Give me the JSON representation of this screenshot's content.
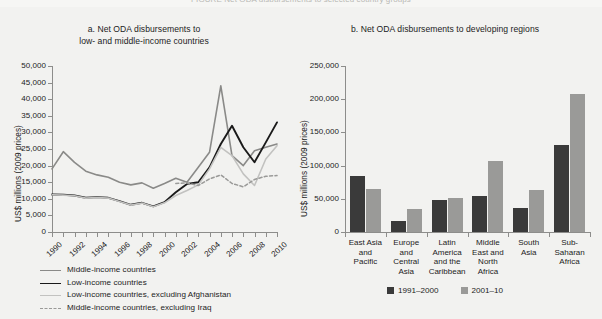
{
  "page": {
    "cropped_header": "FIGURE  Net ODA disbursements to selected country groups"
  },
  "panel_a": {
    "title_line1": "a.  Net ODA disbursements to",
    "title_line2": "low- and middle-income countries",
    "ylabel": "US$ millions (2009 prices)",
    "legend": [
      {
        "label": "Middle-income countries",
        "color": "#8a8a88",
        "style": "solid",
        "width": 1.6
      },
      {
        "label": "Low-income countries",
        "color": "#1a1a1a",
        "style": "solid",
        "width": 1.8
      },
      {
        "label": "Low-income countries, excluding Afghanistan",
        "color": "#c2c2c0",
        "style": "solid",
        "width": 1.6
      },
      {
        "label": "Middle-income countries, excluding Iraq",
        "color": "#9a9a98",
        "style": "dashed",
        "width": 1.5
      }
    ]
  },
  "panel_b": {
    "title": "b.  Net ODA disbursements to developing regions",
    "ylabel": "US$ millions (2009 prices)",
    "legend": [
      {
        "label": "1991–2000",
        "color": "#3a3a3a"
      },
      {
        "label": "2001–10",
        "color": "#9a9a98"
      }
    ]
  },
  "chart_data": [
    {
      "type": "line",
      "id": "panel-a",
      "title": "a. Net ODA disbursements to low- and middle-income countries",
      "xlabel": "",
      "ylabel": "US$ millions (2009 prices)",
      "ylim": [
        0,
        50000
      ],
      "yticks": [
        "0",
        "5,000",
        "10,000",
        "15,000",
        "20,000",
        "25,000",
        "30,000",
        "35,000",
        "40,000",
        "45,000",
        "50,000"
      ],
      "xlim": [
        1990,
        2010
      ],
      "xticks": [
        "1990",
        "1992",
        "1994",
        "1996",
        "1998",
        "2000",
        "2002",
        "2004",
        "2006",
        "2008",
        "2010"
      ],
      "x": [
        1990,
        1991,
        1992,
        1993,
        1994,
        1995,
        1996,
        1997,
        1998,
        1999,
        2000,
        2001,
        2002,
        2003,
        2004,
        2005,
        2006,
        2007,
        2008,
        2009,
        2010
      ],
      "grid": false,
      "legend_position": "below",
      "series": [
        {
          "name": "Middle-income countries",
          "color": "#8a8a88",
          "style": "solid",
          "values": [
            19000,
            24200,
            21000,
            18300,
            17200,
            16500,
            15000,
            14200,
            14800,
            13200,
            14600,
            16200,
            15000,
            19500,
            24000,
            44000,
            23000,
            20000,
            24500,
            25500,
            26500
          ]
        },
        {
          "name": "Low-income countries",
          "color": "#1a1a1a",
          "style": "solid",
          "values": [
            11300,
            11200,
            11000,
            10300,
            10500,
            10300,
            9300,
            8200,
            8800,
            7700,
            9000,
            12000,
            14500,
            15000,
            19500,
            26500,
            32000,
            25500,
            21000,
            27000,
            33000
          ]
        },
        {
          "name": "Low-income countries, excluding Afghanistan",
          "color": "#c2c2c0",
          "style": "solid",
          "values": [
            11200,
            11100,
            10900,
            10200,
            10400,
            10200,
            9200,
            8100,
            8700,
            7600,
            8800,
            11000,
            12500,
            14200,
            19000,
            25500,
            23000,
            17500,
            14000,
            22000,
            26000
          ]
        },
        {
          "name": "Middle-income countries, excluding Iraq",
          "color": "#9a9a98",
          "style": "dashed",
          "values": [
            null,
            null,
            null,
            null,
            null,
            null,
            null,
            null,
            null,
            null,
            null,
            14600,
            14800,
            14000,
            16000,
            17200,
            14600,
            13600,
            15800,
            16800,
            17000
          ]
        }
      ]
    },
    {
      "type": "bar",
      "id": "panel-b",
      "title": "b. Net ODA disbursements to developing regions",
      "xlabel": "",
      "ylabel": "US$ millions (2009 prices)",
      "ylim": [
        0,
        250000
      ],
      "yticks": [
        "0",
        "50,000",
        "100,000",
        "150,000",
        "200,000",
        "250,000"
      ],
      "grid": false,
      "legend_position": "below",
      "categories": [
        [
          "East Asia",
          "and",
          "Pacific"
        ],
        [
          "Europe",
          "and",
          "Central",
          "Asia"
        ],
        [
          "Latin",
          "America",
          "and the",
          "Caribbean"
        ],
        [
          "Middle",
          "East and",
          "North",
          "Africa"
        ],
        [
          "South",
          "Asia"
        ],
        [
          "Sub-Saharan",
          "Africa"
        ]
      ],
      "series": [
        {
          "name": "1991–2000",
          "color": "#3a3a3a",
          "values": [
            84000,
            17000,
            49000,
            55000,
            36000,
            131000
          ]
        },
        {
          "name": "2001–10",
          "color": "#9a9a98",
          "values": [
            65000,
            35000,
            52000,
            107000,
            64000,
            208000
          ]
        }
      ]
    }
  ]
}
